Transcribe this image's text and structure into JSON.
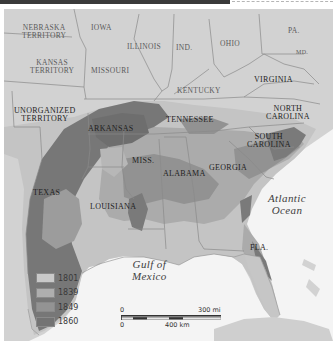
{
  "header": {
    "bar_color": "#3a3a3a"
  },
  "map": {
    "title_visible": false,
    "states": [
      {
        "name": "NEBRASKA TERRITORY",
        "lines": [
          "NEBRASKA",
          "TERRITORY"
        ]
      },
      {
        "name": "IOWA",
        "lines": [
          "IOWA"
        ]
      },
      {
        "name": "KANSAS TERRITORY",
        "lines": [
          "KANSAS",
          "TERRITORY"
        ]
      },
      {
        "name": "MISSOURI",
        "lines": [
          "MISSOURI"
        ]
      },
      {
        "name": "ILLINOIS",
        "lines": [
          "ILLINOIS"
        ]
      },
      {
        "name": "IND.",
        "lines": [
          "IND."
        ]
      },
      {
        "name": "OHIO",
        "lines": [
          "OHIO"
        ]
      },
      {
        "name": "PA.",
        "lines": [
          "PA."
        ]
      },
      {
        "name": "MD.",
        "lines": [
          "MD."
        ]
      },
      {
        "name": "KENTUCKY",
        "lines": [
          "KENTUCKY"
        ]
      },
      {
        "name": "VIRGINIA",
        "lines": [
          "VIRGINIA"
        ]
      },
      {
        "name": "UNORGANIZED TERRITORY",
        "lines": [
          "UNORGANIZED",
          "TERRITORY"
        ]
      },
      {
        "name": "ARKANSAS",
        "lines": [
          "ARKANSAS"
        ]
      },
      {
        "name": "TENNESSEE",
        "lines": [
          "TENNESSEE"
        ]
      },
      {
        "name": "NORTH CAROLINA",
        "lines": [
          "NORTH",
          "CAROLINA"
        ]
      },
      {
        "name": "SOUTH CAROLINA",
        "lines": [
          "SOUTH",
          "CAROLINA"
        ]
      },
      {
        "name": "MISS.",
        "lines": [
          "MISS."
        ]
      },
      {
        "name": "ALABAMA",
        "lines": [
          "ALABAMA"
        ]
      },
      {
        "name": "GEORGIA",
        "lines": [
          "GEORGIA"
        ]
      },
      {
        "name": "TEXAS",
        "lines": [
          "TEXAS"
        ]
      },
      {
        "name": "LOUISIANA",
        "lines": [
          "LOUISIANA"
        ]
      },
      {
        "name": "FLA.",
        "lines": [
          "FLA."
        ]
      }
    ],
    "water": [
      {
        "name": "Atlantic Ocean",
        "lines": [
          "Atlantic",
          "Ocean"
        ]
      },
      {
        "name": "Gulf of Mexico",
        "lines": [
          "Gulf of",
          "Mexico"
        ]
      }
    ],
    "colors": {
      "land_outside": "#cfcfcf",
      "water": "#f4f4f4",
      "border": "#8c8c8c"
    }
  },
  "legend": {
    "items": [
      {
        "label": "1801",
        "color": "#c9c9c9"
      },
      {
        "label": "1839",
        "color": "#aeaeae"
      },
      {
        "label": "1849",
        "color": "#939393"
      },
      {
        "label": "1860",
        "color": "#737373"
      }
    ]
  },
  "scale_bar": {
    "top_zero": "0",
    "top_label": "300 mi",
    "bottom_zero": "0",
    "bottom_label": "400 km"
  }
}
